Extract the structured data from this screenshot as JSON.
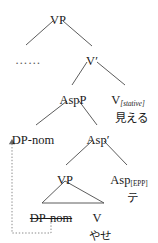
{
  "diagram": {
    "type": "phrase-structure-tree",
    "background_color": "#ffffff",
    "line_color": "#4a4a4a",
    "text_color": "#1a1a1a",
    "movement_line_color": "#8a8a8a"
  },
  "nodes": {
    "vp_top": {
      "label": "VP",
      "x": 58,
      "y": 14
    },
    "ellipsis": {
      "label": "……",
      "x": 28,
      "y": 54
    },
    "v_bar": {
      "label": "V",
      "prime": "′",
      "x": 92,
      "y": 55
    },
    "aspp": {
      "label": "AspP",
      "x": 73,
      "y": 94
    },
    "v_stative": {
      "label": "V",
      "subscript": "[stative]",
      "x": 128,
      "y": 94
    },
    "mieru": {
      "label": "見える",
      "x": 131,
      "y": 113
    },
    "dp_nom_upper": {
      "label": "DP-nom",
      "x": 33,
      "y": 134
    },
    "asp_bar": {
      "label": "Asp",
      "prime": "′",
      "x": 98,
      "y": 134
    },
    "vp_lower": {
      "label": "VP",
      "x": 65,
      "y": 174
    },
    "asp_epp": {
      "label": "Asp",
      "subscript": "[EPP]",
      "x": 129,
      "y": 174
    },
    "te": {
      "label": "テ",
      "x": 132,
      "y": 193
    },
    "dp_nom_trace": {
      "label": "DP-nom",
      "x": 51,
      "y": 212
    },
    "v_lower": {
      "label": "V",
      "x": 97,
      "y": 212
    },
    "yase": {
      "label": "やせ",
      "x": 100,
      "y": 231
    }
  },
  "branches": [
    {
      "name": "vp-top-to-ellipsis",
      "x1": 53,
      "y1": 21,
      "x2": 26,
      "y2": 45
    },
    {
      "name": "vp-top-to-v-bar",
      "x1": 63,
      "y1": 21,
      "x2": 92,
      "y2": 46
    },
    {
      "name": "v-bar-to-aspp",
      "x1": 87,
      "y1": 62,
      "x2": 72,
      "y2": 85
    },
    {
      "name": "v-bar-to-v-stative",
      "x1": 97,
      "y1": 62,
      "x2": 125,
      "y2": 85
    },
    {
      "name": "aspp-to-dp-nom",
      "x1": 67,
      "y1": 101,
      "x2": 36,
      "y2": 125
    },
    {
      "name": "aspp-to-asp-bar",
      "x1": 79,
      "y1": 101,
      "x2": 97,
      "y2": 125
    },
    {
      "name": "asp-bar-to-vp",
      "x1": 92,
      "y1": 141,
      "x2": 66,
      "y2": 165
    },
    {
      "name": "asp-bar-to-asp-epp",
      "x1": 104,
      "y1": 141,
      "x2": 127,
      "y2": 165
    }
  ],
  "triangle": {
    "name": "vp-triangle",
    "apex_x": 65,
    "apex_y": 181,
    "left_x": 42,
    "left_y": 203,
    "right_x": 104,
    "right_y": 203
  },
  "movement": {
    "name": "dp-nom-movement-arrow",
    "description": "dotted movement arrow from trace DP-nom up to DP-nom",
    "path": "M 51 219 L 51 233 L 12 233 L 12 143",
    "arrow_x": 12,
    "arrow_y": 139
  }
}
